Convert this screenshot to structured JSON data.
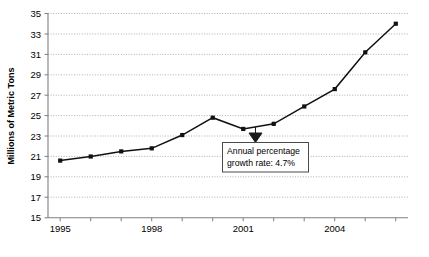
{
  "chart_data": {
    "type": "line",
    "title": "",
    "xlabel": "",
    "ylabel": "Millions of Metric Tons",
    "x": [
      1995,
      1996,
      1997,
      1998,
      1999,
      2000,
      2001,
      2002,
      2003,
      2004,
      2005,
      2006
    ],
    "values": [
      20.6,
      21.0,
      21.5,
      21.8,
      23.1,
      24.8,
      23.7,
      24.2,
      25.9,
      27.6,
      31.2,
      34.0
    ],
    "series": [
      {
        "name": "Production",
        "values": [
          20.6,
          21.0,
          21.5,
          21.8,
          23.1,
          24.8,
          23.7,
          24.2,
          25.9,
          27.6,
          31.2,
          34.0
        ]
      }
    ],
    "xlim": [
      1994.6,
      2006.4
    ],
    "ylim": [
      15,
      35
    ],
    "ytick_labels": [
      "35",
      "33",
      "31",
      "29",
      "27",
      "25",
      "23",
      "21",
      "19",
      "17",
      "15"
    ],
    "ytick_values": [
      35,
      33,
      31,
      29,
      27,
      25,
      23,
      21,
      19,
      17,
      15
    ],
    "xtick_values": [
      1995,
      1996,
      1997,
      1998,
      1999,
      2000,
      2001,
      2002,
      2003,
      2004,
      2005,
      2006
    ],
    "xtick_labels": [
      "1995",
      "",
      "",
      "1998",
      "",
      "",
      "2001",
      "",
      "",
      "2004",
      "",
      ""
    ],
    "xtick_labels_shown": [
      "1995",
      "1998",
      "2001",
      "2004"
    ],
    "grid": "horizontal",
    "legend": "none",
    "annotations": [
      {
        "name": "growth-rate-callout",
        "line1": "Annual percentage",
        "line2": "growth rate: 4.7%",
        "text": "Annual percentage growth rate: 4.7%",
        "points_to_x": 2001,
        "points_to_y": 23.7
      }
    ],
    "colors": {
      "line": "#111111",
      "marker": "#111111",
      "grid": "#9a9a9a",
      "axis": "#7f7f7f",
      "text": "#000000",
      "background": "#ffffff",
      "callout_border": "#4a4a4a"
    }
  }
}
